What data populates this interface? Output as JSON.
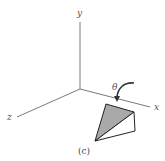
{
  "figure": {
    "caption": "(c)",
    "axes": {
      "y_label": "y",
      "x_label": "x",
      "z_label": "z"
    },
    "rotation": {
      "angle_label": "θ",
      "direction": "rotation about x-axis"
    },
    "colors": {
      "axis_line": "#666666",
      "shaded_face": "#a9a9a9",
      "outline": "#222222",
      "background": "#ffffff"
    }
  }
}
